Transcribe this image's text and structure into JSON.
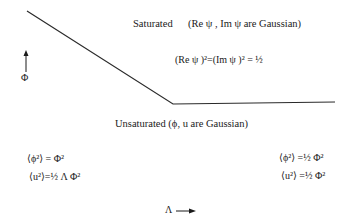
{
  "diagram": {
    "boundary_line": {
      "points": [
        [
          27,
          11
        ],
        [
          173,
          104
        ],
        [
          335,
          102
        ]
      ],
      "color": "#2a2a2a"
    },
    "y_axis": {
      "label": "Φ",
      "arrow": "up-arrow"
    },
    "x_axis": {
      "label": "Λ",
      "arrow": "right-arrow"
    },
    "saturated": {
      "heading": "Saturated",
      "condition": "(Re ψ , Im ψ  are Gaussian)",
      "equation": "(Re ψ )²=(Im ψ )² = ½"
    },
    "unsaturated": {
      "heading": "Unsaturated (ϕ, u are Gaussian)",
      "left": {
        "eq1": "⟨ϕ²⟩ = Φ²",
        "eq2": "⟨u²⟩=½ Λ Φ²"
      },
      "right": {
        "eq1": "⟨ϕ²⟩ =½ Φ²",
        "eq2": "⟨u²⟩ =½ Φ²"
      }
    }
  }
}
